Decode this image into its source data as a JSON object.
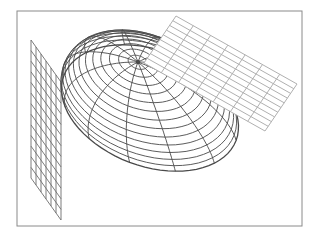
{
  "figure": {
    "width": 316,
    "height": 238,
    "background": "#ffffff",
    "frame": {
      "x": 17,
      "y": 11,
      "width": 285,
      "height": 215,
      "stroke": "#8a8a8a",
      "stroke_width": 1
    }
  },
  "ellipsoid": {
    "stroke": "#4a4a4a",
    "stroke_width": 0.9,
    "pole": [
      138,
      62
    ],
    "outline": {
      "top_left": [
        62,
        82
      ],
      "top_right": [
        157,
        42
      ],
      "right_tip": [
        241,
        121
      ],
      "bottom": [
        128,
        168
      ],
      "left_bottom": [
        63,
        150
      ]
    },
    "latitude_rings": 14,
    "meridians": 12
  },
  "left_plane": {
    "stroke": "#6e6e6e",
    "stroke_width": 0.9,
    "fill": "none",
    "corners": {
      "top_left": [
        31,
        40
      ],
      "top_right": [
        61,
        82
      ],
      "bottom_right": [
        61,
        220
      ],
      "bottom_left": [
        31,
        178
      ]
    },
    "columns": 6,
    "rows": 13
  },
  "right_plane": {
    "stroke": "#b0b0b0",
    "stroke_width": 1,
    "fill": "#ffffff",
    "corners": {
      "top": [
        176,
        16
      ],
      "right": [
        297,
        84
      ],
      "bottom": [
        265,
        131
      ],
      "left": [
        144,
        63
      ]
    },
    "columns": 7,
    "rows": 10
  }
}
